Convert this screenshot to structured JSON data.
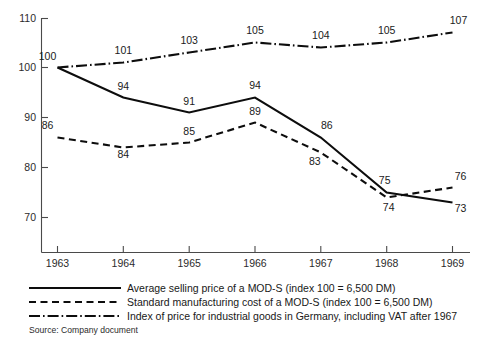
{
  "chart_data": {
    "type": "line",
    "title": "",
    "xlabel": "",
    "ylabel": "",
    "x": [
      1963,
      1964,
      1965,
      1966,
      1967,
      1968,
      1969
    ],
    "xtick_labels": [
      "1963",
      "1964",
      "1965",
      "1966",
      "1967",
      "1968",
      "1969"
    ],
    "ytick_labels": [
      "110",
      "100",
      "90",
      "80",
      "70"
    ],
    "yticks": [
      110,
      100,
      90,
      80,
      70
    ],
    "ylim": [
      68,
      111
    ],
    "xlim": [
      1962.6,
      1969.5
    ],
    "grid": false,
    "legend_position": "below-axes",
    "series": [
      {
        "name": "Average selling price of a MOD-S (index 100  =  6,500 DM)",
        "style": "solid",
        "values": [
          100,
          94,
          91,
          94,
          86,
          75,
          73
        ],
        "labels": [
          "100",
          "94",
          "91",
          "94",
          "86",
          "75",
          "73"
        ]
      },
      {
        "name": "Standard manufacturing cost of a MOD-S (index 100  =  6,500 DM)",
        "style": "dashed",
        "values": [
          86,
          84,
          85,
          89,
          83,
          74,
          76
        ],
        "labels": [
          "86",
          "84",
          "85",
          "89",
          "83",
          "74",
          "76"
        ]
      },
      {
        "name": "Index of price for industrial goods in Germany, including VAT after 1967",
        "style": "dash-dot",
        "values": [
          100,
          101,
          103,
          105,
          104,
          105,
          107
        ],
        "labels": [
          "100",
          "101",
          "103",
          "105",
          "104",
          "105",
          "107"
        ]
      }
    ]
  },
  "legend": {
    "items": [
      {
        "label": "Average selling price of a MOD-S (index 100  =  6,500 DM)",
        "style": "solid"
      },
      {
        "label": "Standard manufacturing cost of a MOD-S (index 100  =  6,500 DM)",
        "style": "dashed"
      },
      {
        "label": "Index of price for industrial goods in Germany, including VAT after 1967",
        "style": "dash-dot"
      }
    ]
  },
  "source": {
    "text": "Source: Company document"
  },
  "colors": {
    "ink": "#0d0d0d",
    "axis": "#4a4a4a",
    "background": "#ffffff"
  }
}
